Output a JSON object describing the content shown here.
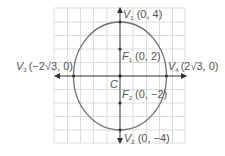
{
  "diagram": {
    "colors": {
      "grid": "#dcdcdc",
      "axis": "#333333",
      "ellipse": "#707070",
      "text": "#555555",
      "point": "#333333"
    },
    "center": {
      "name": "C",
      "coords": "(0, 0)"
    },
    "vertices": [
      {
        "id": "V1",
        "letter": "V",
        "sub": "1",
        "coords": "(0, 4)"
      },
      {
        "id": "V2",
        "letter": "V",
        "sub": "2",
        "coords": "(0, −4)"
      },
      {
        "id": "V3",
        "letter": "V",
        "sub": "3",
        "coords": "(−2√3, 0)"
      },
      {
        "id": "V4",
        "letter": "V",
        "sub": "4",
        "coords": "(2√3, 0)"
      }
    ],
    "foci": [
      {
        "id": "F1",
        "letter": "F",
        "sub": "1",
        "coords": "(0, 2)"
      },
      {
        "id": "F2",
        "letter": "F",
        "sub": "2",
        "coords": "(0, −2)"
      }
    ],
    "labels": {
      "center": "C"
    }
  }
}
